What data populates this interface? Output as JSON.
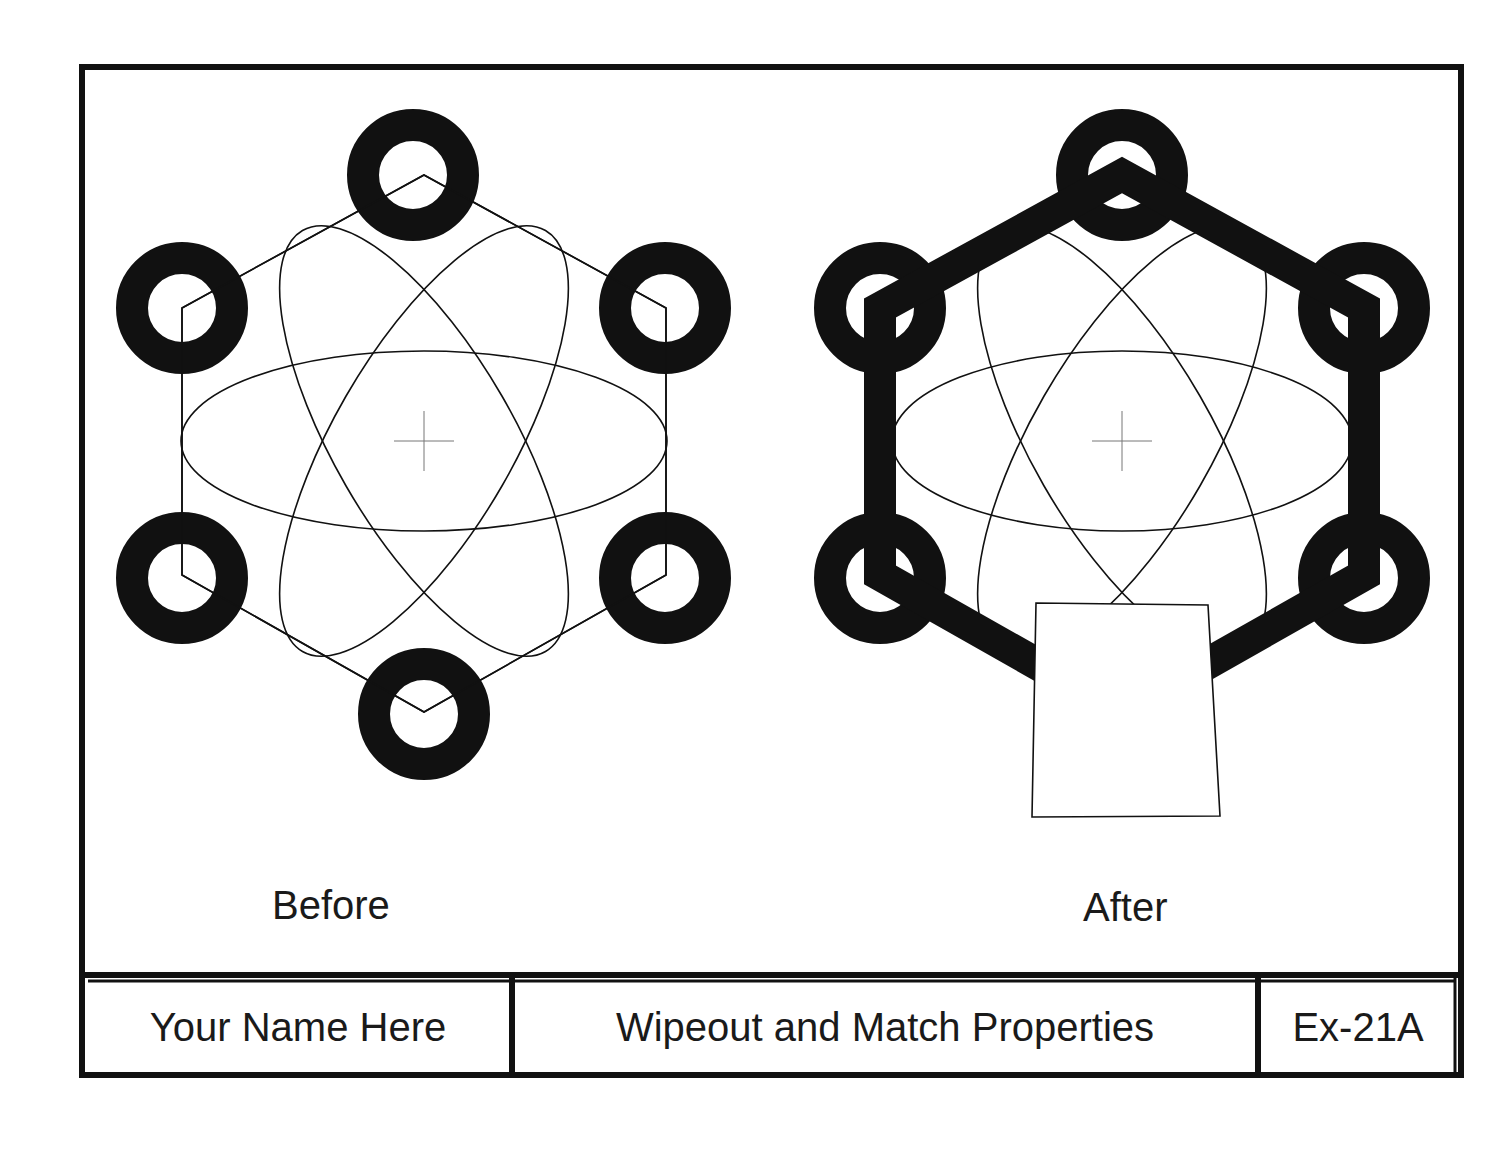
{
  "sheet": {
    "colors": {
      "ink": "#111111",
      "paper": "#ffffff",
      "centermark": "#777777"
    }
  },
  "figures": [
    {
      "id": "before",
      "caption": "Before",
      "center": [
        424,
        441
      ],
      "hexagon_edge_style": "thin",
      "has_wipeout": false
    },
    {
      "id": "after",
      "caption": "After",
      "center": [
        1122,
        441
      ],
      "hexagon_edge_style": "thick",
      "has_wipeout": true,
      "wipeout_polygon": [
        [
          1036,
          603
        ],
        [
          1208,
          605
        ],
        [
          1220,
          816
        ],
        [
          1032,
          817
        ]
      ]
    }
  ],
  "title_block": {
    "name": "Your Name Here",
    "title": "Wipeout and Match Properties",
    "exercise": "Ex-21A"
  }
}
